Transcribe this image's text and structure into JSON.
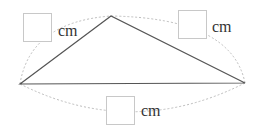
{
  "figure": {
    "type": "triangle-with-side-length-blanks",
    "colors": {
      "edge": "#555555",
      "dashed_arc": "#bdbdbd",
      "box_border": "#c8c8c8",
      "text": "#333333"
    },
    "vertices": {
      "left": [
        20,
        84
      ],
      "top": [
        111,
        16
      ],
      "right": [
        245,
        83
      ]
    },
    "labels": {
      "left_side": {
        "value": "",
        "unit": "cm"
      },
      "right_side": {
        "value": "",
        "unit": "cm"
      },
      "base": {
        "value": "",
        "unit": "cm"
      }
    }
  }
}
